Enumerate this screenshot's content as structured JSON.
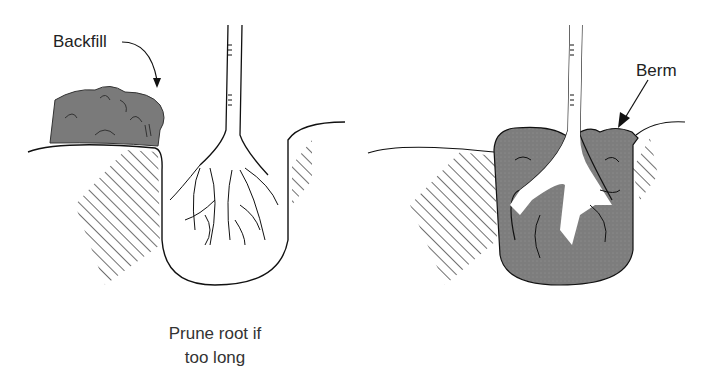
{
  "diagram": {
    "type": "planting-illustration",
    "panels": [
      {
        "id": "left",
        "labels": {
          "backfill": "Backfill",
          "caption_line1": "Prune root if",
          "caption_line2": "too long"
        }
      },
      {
        "id": "right",
        "labels": {
          "berm": "Berm"
        }
      }
    ],
    "colors": {
      "soil_fill": "#7a7a7a",
      "line": "#111111",
      "background": "#ffffff"
    }
  }
}
